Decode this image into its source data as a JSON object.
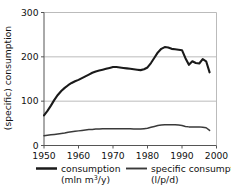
{
  "chart_data": {
    "type": "line",
    "title": "",
    "xlabel": "",
    "ylabel": "(specific) consumption",
    "xlim": [
      1950,
      2000
    ],
    "ylim": [
      0,
      300
    ],
    "xticks": [
      1950,
      1960,
      1970,
      1980,
      1990,
      2000
    ],
    "yticks": [
      0,
      100,
      200,
      300
    ],
    "grid": "horizontal",
    "legend_position": "bottom",
    "series": [
      {
        "name": "consumption",
        "unit": "(mln m3/y)",
        "unit_prefix": "(mln m",
        "unit_sup": "3",
        "unit_suffix": "/y)",
        "color": "#1a1a1a",
        "width": 2.1,
        "x": [
          1950,
          1951,
          1952,
          1953,
          1954,
          1955,
          1956,
          1957,
          1958,
          1959,
          1960,
          1961,
          1962,
          1963,
          1964,
          1965,
          1966,
          1967,
          1968,
          1969,
          1970,
          1971,
          1972,
          1973,
          1974,
          1975,
          1976,
          1977,
          1978,
          1979,
          1980,
          1981,
          1982,
          1983,
          1984,
          1985,
          1986,
          1987,
          1988,
          1989,
          1990,
          1991,
          1992,
          1993,
          1994,
          1995,
          1996,
          1997,
          1998
        ],
        "values": [
          68,
          78,
          90,
          103,
          114,
          123,
          130,
          136,
          141,
          145,
          148,
          152,
          156,
          160,
          164,
          167,
          169,
          171,
          173,
          175,
          177,
          177,
          176,
          175,
          174,
          173,
          172,
          171,
          170,
          172,
          176,
          186,
          198,
          210,
          218,
          222,
          221,
          218,
          217,
          216,
          215,
          197,
          182,
          190,
          186,
          185,
          195,
          190,
          165
        ]
      },
      {
        "name": "specific consumption",
        "unit": "(l/p/d)",
        "color": "#3a3a3a",
        "width": 1.5,
        "x": [
          1950,
          1951,
          1952,
          1953,
          1954,
          1955,
          1956,
          1957,
          1958,
          1959,
          1960,
          1961,
          1962,
          1963,
          1964,
          1965,
          1966,
          1967,
          1968,
          1969,
          1970,
          1971,
          1972,
          1973,
          1974,
          1975,
          1976,
          1977,
          1978,
          1979,
          1980,
          1981,
          1982,
          1983,
          1984,
          1985,
          1986,
          1987,
          1988,
          1989,
          1990,
          1991,
          1992,
          1993,
          1994,
          1995,
          1996,
          1997,
          1998
        ],
        "values": [
          22,
          23,
          24,
          25,
          26,
          27,
          28,
          30,
          31,
          32,
          33,
          34,
          35,
          36,
          36,
          37,
          37,
          38,
          38,
          38,
          38,
          38,
          38,
          38,
          38,
          38,
          37,
          37,
          37,
          38,
          39,
          41,
          43,
          45,
          46,
          47,
          47,
          47,
          47,
          46,
          45,
          43,
          42,
          42,
          42,
          42,
          41,
          40,
          34
        ]
      }
    ]
  },
  "axis": {
    "ylabel": "(specific) consumption",
    "ytick_labels": [
      "300",
      "200",
      "100",
      "0"
    ],
    "xtick_labels": [
      "1950",
      "1960",
      "1970",
      "1980",
      "1990",
      "2000"
    ]
  },
  "legend": {
    "entries": [
      {
        "label": "consumption",
        "unit_prefix": "(mln m",
        "unit_sup": "3",
        "unit_suffix": "/y)"
      },
      {
        "label": "specific consumption",
        "unit_prefix": "(l/p/d)",
        "unit_sup": "",
        "unit_suffix": ""
      }
    ]
  },
  "colors": {
    "line_primary": "#1a1a1a",
    "line_secondary": "#3a3a3a",
    "grid": "#b3b3b3",
    "axis": "#555555",
    "background": "#ffffff"
  }
}
